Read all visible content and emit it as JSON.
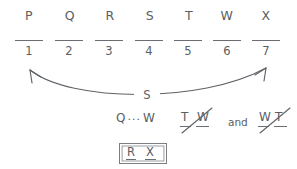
{
  "diagram": {
    "type": "logic-game-scratchwork",
    "background_color": "#ffffff",
    "ink_color": "#5a5e63",
    "variables": [
      {
        "label": "P",
        "x": 16
      },
      {
        "label": "Q",
        "x": 57
      },
      {
        "label": "R",
        "x": 97
      },
      {
        "label": "S",
        "x": 137
      },
      {
        "label": "T",
        "x": 176
      },
      {
        "label": "W",
        "x": 214
      },
      {
        "label": "X",
        "x": 253
      }
    ],
    "slots": [
      {
        "number": "1",
        "x": 14
      },
      {
        "number": "2",
        "x": 54
      },
      {
        "number": "3",
        "x": 94
      },
      {
        "number": "4",
        "x": 134
      },
      {
        "number": "5",
        "x": 173
      },
      {
        "number": "6",
        "x": 212
      },
      {
        "number": "7",
        "x": 251
      }
    ],
    "arrow": {
      "label": "S",
      "style": "double-headed-curve",
      "from_slot": "1",
      "to_slot": "7"
    },
    "notes": {
      "sequence": {
        "first": "Q",
        "ellipsis": "...",
        "second": "W"
      },
      "conjunction": "and",
      "eliminated_pairs": [
        {
          "first": "T",
          "second": "W"
        },
        {
          "first": "W",
          "second": "T"
        }
      ]
    },
    "result": {
      "first": "R",
      "second": "X"
    }
  }
}
